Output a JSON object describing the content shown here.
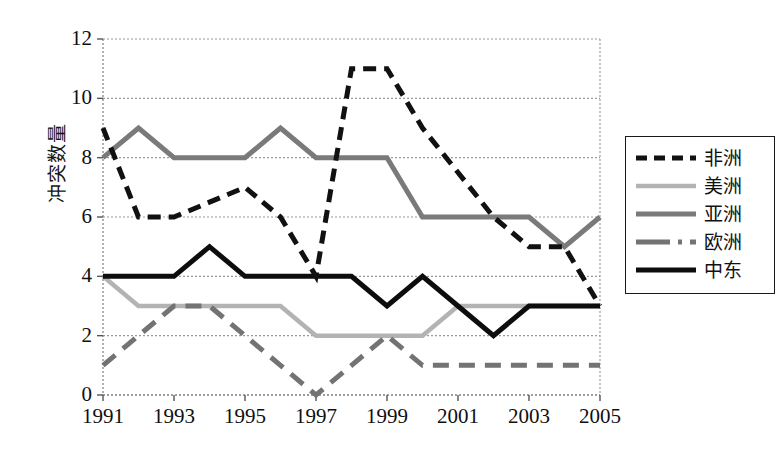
{
  "chart_data": {
    "type": "line",
    "title": "",
    "xlabel": "",
    "ylabel": "冲突数量",
    "x": [
      1991,
      1992,
      1993,
      1994,
      1995,
      1996,
      1997,
      1998,
      1999,
      2000,
      2001,
      2002,
      2003,
      2004,
      2005
    ],
    "xtick_labels": [
      "1991",
      "1993",
      "1995",
      "1997",
      "1999",
      "2001",
      "2003",
      "2005"
    ],
    "xtick_values": [
      1991,
      1993,
      1995,
      1997,
      1999,
      2001,
      2003,
      2005
    ],
    "ytick_labels": [
      "0",
      "2",
      "4",
      "6",
      "8",
      "10",
      "12"
    ],
    "ytick_values": [
      0,
      2,
      4,
      6,
      8,
      10,
      12
    ],
    "ylim": [
      0,
      12
    ],
    "xlim": [
      1991,
      2005
    ],
    "grid": "horizontal",
    "legend_position": "right",
    "series": [
      {
        "name": "非洲",
        "style": "dashed",
        "color": "#111111",
        "width": 5,
        "dash": "13,8",
        "values": [
          9,
          6,
          6,
          6.5,
          7,
          6,
          4,
          11,
          11,
          9,
          7.5,
          6,
          5,
          5,
          3
        ]
      },
      {
        "name": "美洲",
        "style": "solid",
        "color": "#b3b3b3",
        "width": 4.5,
        "dash": "none",
        "values": [
          4,
          3,
          3,
          3,
          3,
          3,
          2,
          2,
          2,
          2,
          3,
          3,
          3,
          3,
          3
        ]
      },
      {
        "name": "亚洲",
        "style": "solid",
        "color": "#7a7a7a",
        "width": 5,
        "dash": "none",
        "values": [
          8,
          9,
          8,
          8,
          8,
          9,
          8,
          8,
          8,
          6,
          6,
          6,
          6,
          5,
          6
        ]
      },
      {
        "name": "欧洲",
        "style": "dash-dot",
        "color": "#737373",
        "width": 5,
        "dash": "16,10",
        "values": [
          1,
          2,
          3,
          3,
          2,
          1,
          0,
          1,
          2,
          1,
          1,
          1,
          1,
          1,
          1
        ]
      },
      {
        "name": "中东",
        "style": "solid",
        "color": "#0d0d0d",
        "width": 5,
        "dash": "none",
        "values": [
          4,
          4,
          4,
          5,
          4,
          4,
          4,
          4,
          3,
          4,
          3,
          2,
          3,
          3,
          3
        ]
      }
    ]
  },
  "legend": {
    "items": [
      {
        "label": "非洲"
      },
      {
        "label": "美洲"
      },
      {
        "label": "亚洲"
      },
      {
        "label": "欧洲"
      },
      {
        "label": "中东"
      }
    ]
  }
}
